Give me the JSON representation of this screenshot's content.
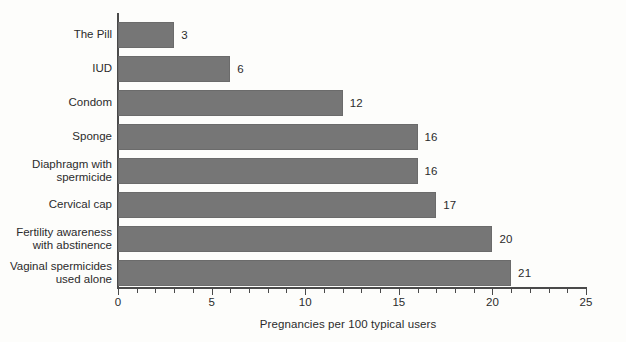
{
  "chart_data": {
    "type": "bar",
    "orientation": "horizontal",
    "title": "",
    "xlabel": "Pregnancies per 100 typical users",
    "ylabel": "",
    "xlim": [
      0,
      25
    ],
    "xticks": [
      0,
      5,
      10,
      15,
      20,
      25
    ],
    "xtick_labels": [
      "0",
      "5",
      "10",
      "15",
      "20",
      "25"
    ],
    "minor_tick_interval": 1,
    "grid": false,
    "legend": false,
    "bar_color": "#767676",
    "axis_color": "#4a4a4a",
    "background_color": "#fdfdfb",
    "categories": [
      "The Pill",
      "IUD",
      "Condom",
      "Sponge",
      "Diaphragm with\nspermicide",
      "Cervical cap",
      "Fertility awareness\nwith abstinence",
      "Vaginal spermicides\nused alone"
    ],
    "values": [
      3,
      6,
      12,
      16,
      16,
      17,
      20,
      21
    ],
    "value_labels": [
      "3",
      "6",
      "12",
      "16",
      "16",
      "17",
      "20",
      "21"
    ]
  }
}
